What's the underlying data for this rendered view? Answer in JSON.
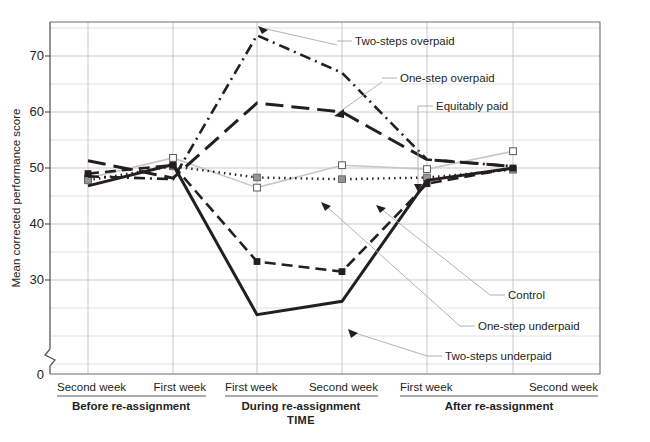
{
  "chart_data": {
    "type": "line",
    "title": "",
    "subtitle": "",
    "xlabel": "TIME",
    "ylabel": "Mean corrected performance score",
    "ylim": [
      0,
      75
    ],
    "y_ticks": [
      30,
      40,
      50,
      60,
      70
    ],
    "y_tick_labels": [
      "30",
      "40",
      "50",
      "60",
      "70"
    ],
    "y_minor_step": 5,
    "y_axis_break": true,
    "y_axis_zero_label": "0",
    "grid": true,
    "legend_position": "inline-callouts",
    "categories": [
      "Second week",
      "First week",
      "First week",
      "Second week",
      "First week",
      "Second week"
    ],
    "category_groups": [
      {
        "label": "Before re-assignment",
        "categories": [
          "Second week",
          "First week"
        ]
      },
      {
        "label": "During re-assignment",
        "categories": [
          "First week",
          "Second week"
        ]
      },
      {
        "label": "After re-assignment",
        "categories": [
          "First week",
          "Second week"
        ]
      }
    ],
    "series": [
      {
        "name": "Two-steps overpaid",
        "values": [
          48.5,
          48.0,
          73.7,
          67.0,
          51.5,
          50.3
        ],
        "color": "#231f20",
        "line_style": "dash-dot",
        "marker": "none",
        "label_position": "top"
      },
      {
        "name": "One-step overpaid",
        "values": [
          51.3,
          48.2,
          61.6,
          60.0,
          51.5,
          50.3
        ],
        "color": "#231f20",
        "line_style": "long-dash",
        "marker": "none",
        "label_position": "top"
      },
      {
        "name": "Equitably paid",
        "values": [
          48.2,
          51.8,
          46.5,
          50.5,
          49.8,
          53.0
        ],
        "color": "#c6c7c8",
        "line_style": "solid",
        "marker": "open-square",
        "label_position": "top"
      },
      {
        "name": "Control",
        "values": [
          47.8,
          50.3,
          48.3,
          48.0,
          48.3,
          49.7
        ],
        "color": "#231f20",
        "line_style": "dotted",
        "marker": "filled-square-grey",
        "label_position": "right"
      },
      {
        "name": "One-step underpaid",
        "values": [
          49.0,
          50.5,
          33.3,
          31.5,
          47.2,
          50.0
        ],
        "color": "#231f20",
        "line_style": "medium-dash",
        "marker": "filled-square",
        "label_position": "right"
      },
      {
        "name": "Two-steps underpaid",
        "values": [
          46.8,
          50.6,
          23.8,
          26.2,
          47.8,
          50.0
        ],
        "color": "#231f20",
        "line_style": "solid-thick",
        "marker": "none",
        "label_position": "right"
      }
    ],
    "callouts": [
      {
        "text": "Two-steps overpaid",
        "series": "Two-steps overpaid"
      },
      {
        "text": "One-step overpaid",
        "series": "One-step overpaid"
      },
      {
        "text": "Equitably paid",
        "series": "Equitably paid"
      },
      {
        "text": "Control",
        "series": "Control"
      },
      {
        "text": "One-step underpaid",
        "series": "One-step underpaid"
      },
      {
        "text": "Two-steps underpaid",
        "series": "Two-steps underpaid"
      }
    ]
  },
  "axis": {
    "y_title": "Mean corrected performance score",
    "x_title": "TIME",
    "y_labels": {
      "t70": "70",
      "t60": "60",
      "t50": "50",
      "t40": "40",
      "t30": "30",
      "t0": "0"
    }
  },
  "x_labels": {
    "p0": "Second week",
    "p1": "First week",
    "p2": "First week",
    "p3": "Second week",
    "p4": "First week",
    "p5": "Second week"
  },
  "group_labels": {
    "g0": "Before re-assignment",
    "g1": "During re-assignment",
    "g2": "After re-assignment"
  },
  "callout_labels": {
    "c0": "Two-steps overpaid",
    "c1": "One-step overpaid",
    "c2": "Equitably paid",
    "c3": "Control",
    "c4": "One-step underpaid",
    "c5": "Two-steps underpaid"
  },
  "colors": {
    "ink": "#231f20",
    "grid": "#c9c9c9",
    "axis": "#58595b",
    "grey_series": "#c6c7c8",
    "leader": "#a7a9ac",
    "background": "#ffffff"
  }
}
